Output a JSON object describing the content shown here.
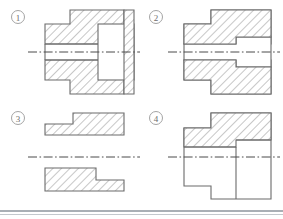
{
  "page": {
    "background_color": "#ffffff",
    "line_color": "#6b6b6b",
    "centerline_color": "#4a4a4a",
    "label_color": "#6d6d6d",
    "footer_rule_color": "#8d949c"
  },
  "figures": [
    {
      "id": "figure-1",
      "label": "1",
      "label_x": 18,
      "label_y": 17,
      "description": "Full section: stepped bushing, hatched upper and lower bands at left, unhatched bore rectangle at right",
      "centerline": {
        "x1": 28,
        "y1": 52,
        "x2": 134,
        "y2": 52
      }
    },
    {
      "id": "figure-2",
      "label": "2",
      "label_x": 156,
      "label_y": 17,
      "description": "Full section: stepped bushing with hatching extending across, tapered bore at centre",
      "centerline": {
        "x1": 168,
        "y1": 52,
        "x2": 276,
        "y2": 52
      }
    },
    {
      "id": "figure-3",
      "label": "3",
      "label_x": 18,
      "label_y": 118,
      "description": "Two separate Z-shaped stepped blocks, hatched, mirrored about the centreline",
      "centerline": {
        "x1": 28,
        "y1": 157,
        "x2": 134,
        "y2": 157
      }
    },
    {
      "id": "figure-4",
      "label": "4",
      "label_x": 156,
      "label_y": 118,
      "description": "Half section: hatched stepped band above the centreline, plain outline below",
      "centerline": {
        "x1": 168,
        "y1": 157,
        "x2": 276,
        "y2": 157
      }
    }
  ],
  "footer": {
    "rule_y": 211,
    "rule2_y": 214
  }
}
